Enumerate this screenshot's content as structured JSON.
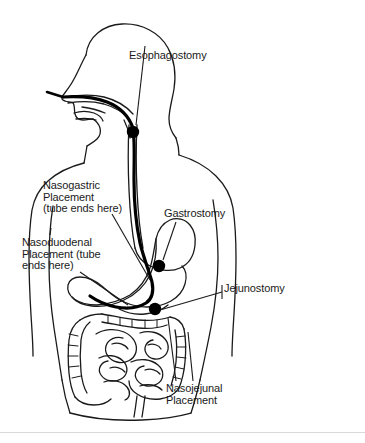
{
  "diagram": {
    "colors": {
      "ink": "#1a1a1a",
      "tube": "#000000",
      "background": "#ffffff",
      "rule": "#d9d9d9"
    },
    "labels": [
      {
        "id": "esophagostomy",
        "text": "Esophagostomy",
        "lines": [
          "Esophagostomy"
        ],
        "marker": "stoma-dot",
        "marker_site": "esophagus"
      },
      {
        "id": "nasogastric",
        "text": "Nasogastric Placement (tube ends here)",
        "lines": [
          "Nasogastric",
          "Placement",
          "(tube ends here)"
        ],
        "marker": "leader-line",
        "marker_site": "stomach"
      },
      {
        "id": "nasoduodenal",
        "text": "Nasoduodenal Placement (tube ends here)",
        "lines": [
          "Nasoduodenal",
          "Placement (tube",
          "ends here)"
        ],
        "marker": "leader-line",
        "marker_site": "duodenum"
      },
      {
        "id": "gastrostomy",
        "text": "Gastrostomy",
        "lines": [
          "Gastrostomy"
        ],
        "marker": "stoma-dot",
        "marker_site": "stomach"
      },
      {
        "id": "jejunostomy",
        "text": "Jejunostomy",
        "lines": [
          "Jejunostomy"
        ],
        "marker": "stoma-dot",
        "marker_site": "jejunum"
      },
      {
        "id": "nasojejunal",
        "text": "Nasojejunal Placement",
        "lines": [
          "Nasojejunal",
          "Placement"
        ],
        "marker": "leader-line",
        "marker_site": "jejunum"
      }
    ]
  }
}
